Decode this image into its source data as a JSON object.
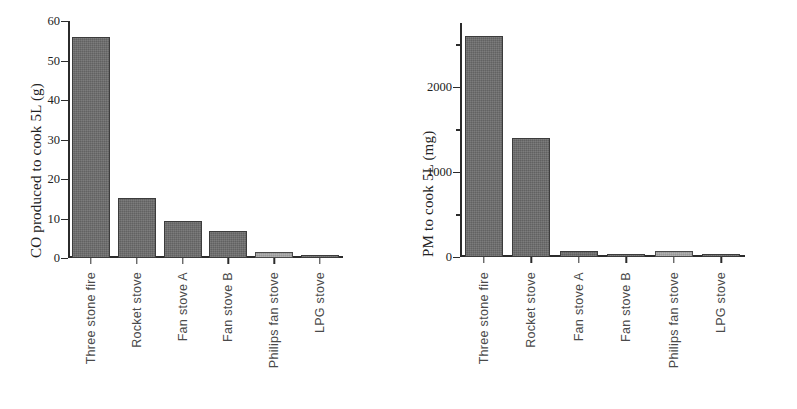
{
  "figure": {
    "background": "#ffffff",
    "bar_color": "#6d6d6d",
    "bar_color_highlight": "#a9a9a9",
    "axis_color": "#2b2b2b"
  },
  "chart_data": [
    {
      "type": "bar",
      "title": "",
      "xlabel": "",
      "ylabel": "CO produced to cook 5L (g)",
      "categories": [
        "Three stone fire",
        "Rocket stove",
        "Fan stove A",
        "Fan stove B",
        "Philips fan stove",
        "LPG stove"
      ],
      "values": [
        56,
        15.2,
        9.3,
        6.9,
        1.5,
        0.5
      ],
      "ylim": [
        0,
        60
      ],
      "yticks": [
        0,
        10,
        20,
        30,
        40,
        50,
        60
      ],
      "ytick_labels": [
        "0",
        "10",
        "20",
        "30",
        "40",
        "50",
        "60"
      ],
      "grid": false,
      "legend": "none",
      "highlight_index": 4
    },
    {
      "type": "bar",
      "title": "",
      "xlabel": "",
      "ylabel": "PM to cook 5L (mg)",
      "categories": [
        "Three stone fire",
        "Rocket stove",
        "Fan stove A",
        "Fan stove B",
        "Philips fan stove",
        "LPG stove"
      ],
      "values": [
        2600,
        1400,
        70,
        40,
        70,
        10
      ],
      "ylim": [
        0,
        2750
      ],
      "yticks": [
        0,
        500,
        1000,
        1500,
        2000,
        2500
      ],
      "ytick_labels": [
        "0",
        "",
        "1000",
        "",
        "2000",
        ""
      ],
      "grid": false,
      "legend": "none",
      "highlight_index": 4
    }
  ]
}
